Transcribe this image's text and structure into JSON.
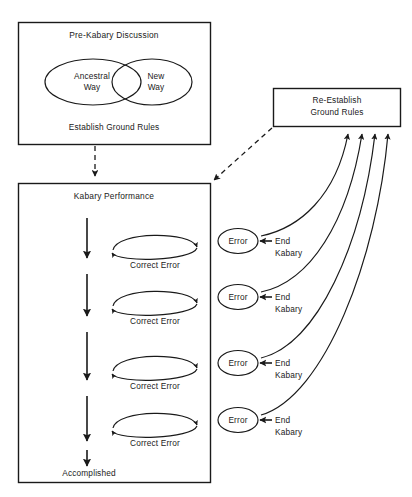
{
  "diagram": {
    "stroke_color": "#1a1a1a",
    "background_color": "#ffffff",
    "pre_kabary_box": {
      "heading": "Pre-Kabary Discussion",
      "footer": "Establish Ground Rules",
      "venn": {
        "left_label_line1": "Ancestral",
        "left_label_line2": "Way",
        "right_label_line1": "New",
        "right_label_line2": "Way"
      }
    },
    "reestablish_box": {
      "line1": "Re-Establish",
      "line2": "Ground Rules"
    },
    "performance_box": {
      "heading": "Kabary Performance",
      "footer": "Accomplished",
      "loops": [
        {
          "label": "Correct Error"
        },
        {
          "label": "Correct Error"
        },
        {
          "label": "Correct Error"
        },
        {
          "label": "Correct Error"
        }
      ],
      "error_nodes": [
        {
          "ellipse_label": "Error",
          "end_line1": "End",
          "end_line2": "Kabary"
        },
        {
          "ellipse_label": "Error",
          "end_line1": "End",
          "end_line2": "Kabary"
        },
        {
          "ellipse_label": "Error",
          "end_line1": "End",
          "end_line2": "Kabary"
        },
        {
          "ellipse_label": "Error",
          "end_line1": "End",
          "end_line2": "Kabary"
        }
      ]
    }
  }
}
